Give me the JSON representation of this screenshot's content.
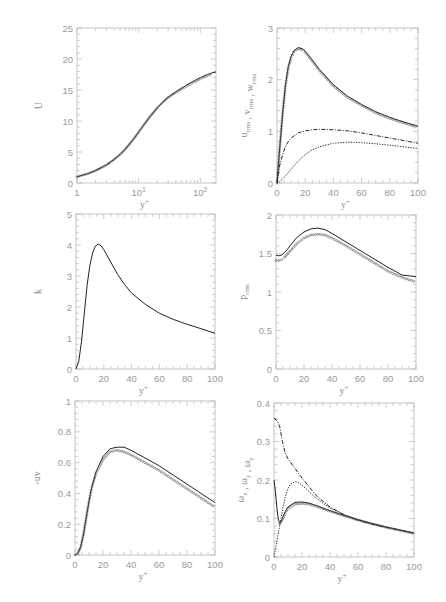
{
  "figure": {
    "width": 446,
    "height": 602,
    "background": "#ffffff",
    "line_color": "#222222",
    "marker_color": "#555555",
    "axis_color": "#b8b8b8",
    "text_color": "#9a9a9a"
  },
  "chart_data": [
    {
      "id": "U",
      "type": "line",
      "title": "",
      "xlabel": "y+",
      "ylabel": "U",
      "xscale": "log",
      "xlim": [
        1,
        180
      ],
      "ylim": [
        0,
        25
      ],
      "xticks": [
        1,
        10,
        100
      ],
      "xtick_labels": [
        "1",
        "10^1",
        "10^2"
      ],
      "yticks": [
        0,
        5,
        10,
        15,
        20,
        25
      ],
      "ytick_labels": [
        "0",
        "5",
        "10",
        "15",
        "20",
        "25"
      ],
      "frame": [
        77,
        28,
        216,
        183
      ],
      "series": [
        {
          "name": "DNS",
          "style": "solid",
          "x": [
            1,
            1.5,
            2,
            3,
            4,
            5,
            6,
            8,
            10,
            12,
            15,
            20,
            25,
            30,
            40,
            50,
            60,
            80,
            100,
            130,
            160,
            180
          ],
          "y": [
            1.0,
            1.5,
            2.0,
            2.9,
            3.8,
            4.6,
            5.4,
            6.9,
            8.2,
            9.3,
            10.6,
            12.1,
            13.1,
            13.8,
            14.7,
            15.3,
            15.8,
            16.5,
            17.0,
            17.5,
            17.8,
            17.9
          ]
        },
        {
          "name": "model",
          "style": "markers",
          "x": [
            1,
            1.5,
            2,
            3,
            4,
            5,
            6,
            8,
            10,
            12,
            15,
            20,
            25,
            30,
            40,
            50,
            60,
            80,
            100,
            130,
            160
          ],
          "y": [
            1.0,
            1.5,
            2.0,
            2.9,
            3.8,
            4.6,
            5.4,
            6.9,
            8.2,
            9.3,
            10.6,
            12.1,
            13.1,
            13.8,
            14.6,
            15.2,
            15.6,
            16.3,
            16.8,
            17.3,
            17.6
          ]
        }
      ]
    },
    {
      "id": "rms_velocity",
      "type": "line",
      "title": "",
      "xlabel": "y+",
      "ylabel": "u_rms , v_rms , w_rms",
      "xscale": "linear",
      "xlim": [
        0,
        100
      ],
      "ylim": [
        0,
        3
      ],
      "xticks": [
        0,
        20,
        40,
        60,
        80,
        100
      ],
      "xtick_labels": [
        "0",
        "20",
        "40",
        "60",
        "80",
        "100"
      ],
      "yticks": [
        0,
        1,
        2,
        3
      ],
      "ytick_labels": [
        "0",
        "1",
        "2",
        "3"
      ],
      "frame": [
        277,
        28,
        418,
        183
      ],
      "series": [
        {
          "name": "u_rms",
          "style": "solid",
          "x": [
            0,
            2,
            4,
            6,
            8,
            10,
            12,
            15,
            18,
            20,
            25,
            30,
            40,
            50,
            60,
            70,
            80,
            90,
            100
          ],
          "y": [
            0,
            0.7,
            1.35,
            1.9,
            2.25,
            2.45,
            2.56,
            2.62,
            2.6,
            2.55,
            2.38,
            2.2,
            1.9,
            1.68,
            1.52,
            1.38,
            1.27,
            1.18,
            1.1
          ]
        },
        {
          "name": "u_rms model",
          "style": "markers",
          "x": [
            0,
            2,
            4,
            6,
            8,
            10,
            12,
            15,
            18,
            20,
            25,
            30,
            40,
            50,
            60,
            70,
            80,
            90,
            100
          ],
          "y": [
            0,
            0.7,
            1.35,
            1.88,
            2.23,
            2.43,
            2.54,
            2.6,
            2.58,
            2.53,
            2.36,
            2.18,
            1.88,
            1.66,
            1.5,
            1.36,
            1.25,
            1.16,
            1.08
          ]
        },
        {
          "name": "w_rms",
          "style": "dashed",
          "x": [
            0,
            2,
            4,
            6,
            8,
            10,
            15,
            20,
            25,
            30,
            40,
            50,
            60,
            70,
            80,
            90,
            100
          ],
          "y": [
            0,
            0.35,
            0.55,
            0.7,
            0.8,
            0.87,
            0.97,
            1.01,
            1.03,
            1.04,
            1.03,
            1.01,
            0.97,
            0.92,
            0.87,
            0.82,
            0.77
          ]
        },
        {
          "name": "v_rms",
          "style": "dotted",
          "x": [
            0,
            2,
            4,
            6,
            8,
            10,
            15,
            20,
            25,
            30,
            40,
            50,
            60,
            70,
            80,
            90,
            100
          ],
          "y": [
            0,
            0.03,
            0.08,
            0.14,
            0.2,
            0.27,
            0.42,
            0.55,
            0.64,
            0.7,
            0.77,
            0.79,
            0.78,
            0.76,
            0.73,
            0.7,
            0.67
          ]
        }
      ]
    },
    {
      "id": "k",
      "type": "line",
      "title": "",
      "xlabel": "y+",
      "ylabel": "k",
      "xscale": "linear",
      "xlim": [
        0,
        100
      ],
      "ylim": [
        0,
        5
      ],
      "xticks": [
        0,
        20,
        40,
        60,
        80,
        100
      ],
      "xtick_labels": [
        "0",
        "20",
        "40",
        "60",
        "80",
        "100"
      ],
      "yticks": [
        0,
        1,
        2,
        3,
        4,
        5
      ],
      "ytick_labels": [
        "0",
        "1",
        "2",
        "3",
        "4",
        "5"
      ],
      "frame": [
        76,
        214,
        215,
        369
      ],
      "series": [
        {
          "name": "k",
          "style": "solid",
          "x": [
            0,
            2,
            4,
            6,
            8,
            10,
            12,
            14,
            16,
            18,
            20,
            25,
            30,
            35,
            40,
            50,
            60,
            70,
            80,
            90,
            100
          ],
          "y": [
            0,
            0.25,
            0.9,
            1.8,
            2.7,
            3.35,
            3.75,
            3.97,
            4.03,
            3.98,
            3.85,
            3.45,
            3.05,
            2.72,
            2.45,
            2.08,
            1.8,
            1.6,
            1.44,
            1.3,
            1.15
          ]
        }
      ]
    },
    {
      "id": "p_rms",
      "type": "line",
      "title": "",
      "xlabel": "y+",
      "ylabel": "p_rms",
      "xscale": "linear",
      "xlim": [
        0,
        100
      ],
      "ylim": [
        0,
        2
      ],
      "xticks": [
        0,
        20,
        40,
        60,
        80,
        100
      ],
      "xtick_labels": [
        "0",
        "20",
        "40",
        "60",
        "80",
        "100"
      ],
      "yticks": [
        0,
        0.5,
        1,
        1.5,
        2
      ],
      "ytick_labels": [
        "0",
        "0.5",
        "1",
        "1.5",
        "2"
      ],
      "frame": [
        276,
        215,
        416,
        369
      ],
      "series": [
        {
          "name": "DNS",
          "style": "solid",
          "x": [
            0,
            2,
            4,
            6,
            8,
            10,
            15,
            20,
            25,
            30,
            35,
            40,
            50,
            60,
            70,
            80,
            90,
            100
          ],
          "y": [
            1.48,
            1.47,
            1.48,
            1.51,
            1.55,
            1.6,
            1.71,
            1.78,
            1.82,
            1.83,
            1.81,
            1.76,
            1.65,
            1.54,
            1.43,
            1.32,
            1.22,
            1.2
          ]
        },
        {
          "name": "model",
          "style": "markers",
          "x": [
            0,
            2,
            4,
            6,
            8,
            10,
            15,
            20,
            25,
            30,
            35,
            40,
            50,
            60,
            70,
            80,
            90,
            100
          ],
          "y": [
            1.41,
            1.41,
            1.42,
            1.45,
            1.49,
            1.53,
            1.63,
            1.7,
            1.74,
            1.75,
            1.74,
            1.7,
            1.6,
            1.49,
            1.38,
            1.27,
            1.19,
            1.13
          ]
        }
      ]
    },
    {
      "id": "uv",
      "type": "line",
      "title": "",
      "xlabel": "y+",
      "ylabel": "-uv",
      "xscale": "linear",
      "xlim": [
        0,
        100
      ],
      "ylim": [
        0,
        1
      ],
      "xticks": [
        0,
        20,
        40,
        60,
        80,
        100
      ],
      "xtick_labels": [
        "0",
        "20",
        "40",
        "60",
        "80",
        "100"
      ],
      "yticks": [
        0,
        0.2,
        0.4,
        0.6,
        0.8,
        1
      ],
      "ytick_labels": [
        "0",
        "0.2",
        "0.4",
        "0.6",
        "0.8",
        "1"
      ],
      "frame": [
        75,
        401,
        215,
        555
      ],
      "series": [
        {
          "name": "DNS",
          "style": "solid",
          "x": [
            0,
            2,
            4,
            6,
            8,
            10,
            12,
            15,
            20,
            25,
            30,
            35,
            40,
            50,
            60,
            70,
            80,
            90,
            100
          ],
          "y": [
            0,
            0.01,
            0.05,
            0.13,
            0.24,
            0.35,
            0.44,
            0.54,
            0.64,
            0.69,
            0.7,
            0.7,
            0.68,
            0.63,
            0.58,
            0.52,
            0.46,
            0.4,
            0.34
          ]
        },
        {
          "name": "model",
          "style": "markers",
          "x": [
            0,
            2,
            4,
            6,
            8,
            10,
            12,
            15,
            20,
            25,
            30,
            35,
            40,
            50,
            60,
            70,
            80,
            90,
            100
          ],
          "y": [
            0,
            0.01,
            0.05,
            0.13,
            0.24,
            0.35,
            0.44,
            0.53,
            0.62,
            0.67,
            0.68,
            0.67,
            0.65,
            0.6,
            0.55,
            0.49,
            0.43,
            0.37,
            0.31
          ]
        }
      ]
    },
    {
      "id": "vorticity",
      "type": "line",
      "title": "",
      "xlabel": "y+",
      "ylabel": "ω_x , ω_y , ω_z",
      "xscale": "linear",
      "xlim": [
        0,
        100
      ],
      "ylim": [
        0,
        0.4
      ],
      "xticks": [
        0,
        20,
        40,
        60,
        80,
        100
      ],
      "xtick_labels": [
        "0",
        "20",
        "40",
        "60",
        "80",
        "100"
      ],
      "yticks": [
        0,
        0.1,
        0.2,
        0.3,
        0.4
      ],
      "ytick_labels": [
        "0",
        "0.1",
        "0.2",
        "0.3",
        "0.4"
      ],
      "frame": [
        274,
        403,
        414,
        557
      ],
      "series": [
        {
          "name": "ω_z",
          "style": "dashed",
          "x": [
            0,
            2,
            4,
            6,
            8,
            10,
            15,
            20,
            30,
            40,
            50,
            60,
            70,
            80,
            90,
            100
          ],
          "y": [
            0.36,
            0.355,
            0.34,
            0.3,
            0.27,
            0.255,
            0.23,
            0.205,
            0.16,
            0.13,
            0.11,
            0.095,
            0.085,
            0.077,
            0.07,
            0.062
          ]
        },
        {
          "name": "ω_y",
          "style": "dotted",
          "x": [
            0,
            2,
            4,
            6,
            8,
            10,
            12,
            15,
            18,
            20,
            25,
            30,
            40,
            50,
            60,
            70,
            80,
            90,
            100
          ],
          "y": [
            0,
            0.04,
            0.08,
            0.12,
            0.155,
            0.178,
            0.19,
            0.196,
            0.192,
            0.187,
            0.17,
            0.153,
            0.127,
            0.11,
            0.097,
            0.087,
            0.078,
            0.07,
            0.063
          ]
        },
        {
          "name": "ω_x",
          "style": "solid",
          "x": [
            0,
            1,
            2,
            3,
            4,
            5,
            6,
            8,
            10,
            15,
            20,
            25,
            30,
            40,
            50,
            60,
            70,
            80,
            90,
            100
          ],
          "y": [
            0.2,
            0.17,
            0.13,
            0.1,
            0.088,
            0.09,
            0.1,
            0.118,
            0.13,
            0.142,
            0.143,
            0.14,
            0.134,
            0.12,
            0.108,
            0.097,
            0.087,
            0.078,
            0.07,
            0.062
          ]
        },
        {
          "name": "ω_x model",
          "style": "markers",
          "x": [
            4,
            6,
            8,
            10,
            15,
            20,
            25,
            30,
            40,
            50,
            60,
            70,
            80,
            90,
            100
          ],
          "y": [
            0.086,
            0.097,
            0.114,
            0.126,
            0.137,
            0.139,
            0.137,
            0.132,
            0.119,
            0.107,
            0.096,
            0.086,
            0.077,
            0.069,
            0.061
          ]
        }
      ]
    }
  ]
}
